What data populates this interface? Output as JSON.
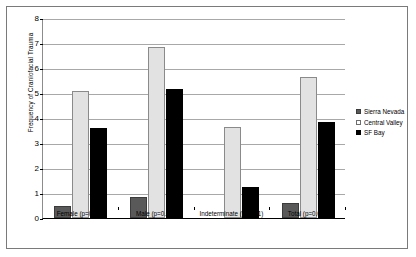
{
  "chart_data": {
    "type": "bar",
    "title": "",
    "xlabel": "",
    "ylabel": "Frequency of Craniofacial Trauma",
    "ylim": [
      0,
      8
    ],
    "ytick_labels": [
      "0",
      "1",
      "2",
      "3",
      "4",
      "5",
      "6",
      "7",
      "8"
    ],
    "ytick_values": [
      0,
      1,
      2,
      3,
      4,
      5,
      6,
      7,
      8
    ],
    "grid": true,
    "legend_position": "right",
    "categories": [
      "Female (p=0.01)",
      "Male (p=0.01)",
      "Indeterminate (p=0.01)",
      "Total (p=0.00)"
    ],
    "series": [
      {
        "name": "Sierra Nevada",
        "color": "#595959",
        "values": [
          0.5,
          0.85,
          0,
          0.6
        ]
      },
      {
        "name": "Central Valley",
        "color": "#e2e2e2",
        "values": [
          5.1,
          6.85,
          3.65,
          5.65
        ]
      },
      {
        "name": "SF Bay",
        "color": "#000000",
        "values": [
          3.6,
          5.15,
          1.25,
          3.85
        ]
      }
    ]
  },
  "legend": {
    "items": [
      {
        "label": "Sierra Nevada",
        "swatch": "sierra"
      },
      {
        "label": "Central Valley",
        "swatch": "central"
      },
      {
        "label": "SF Bay",
        "swatch": "sfbay"
      }
    ]
  }
}
